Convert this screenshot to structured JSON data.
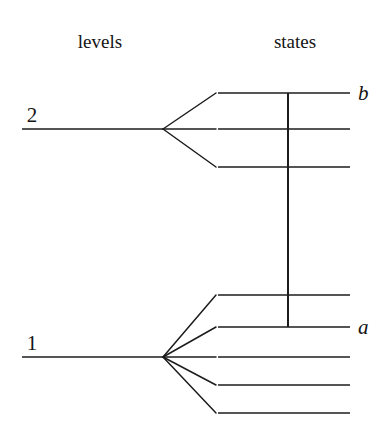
{
  "figure": {
    "title": "",
    "headers": {
      "left": "levels",
      "right": "states"
    },
    "levels": [
      {
        "label": "2",
        "label_x": 32,
        "label_y": 122,
        "line_y": 129,
        "line_x1": 22,
        "line_x2": 163
      },
      {
        "label": "1",
        "label_x": 32,
        "label_y": 350,
        "line_y": 357,
        "line_x1": 22,
        "line_x2": 163
      }
    ],
    "state_groups": [
      {
        "parent_level": "2",
        "vertex_x": 163,
        "vertex_y": 129,
        "line_x1": 218,
        "line_x2": 350,
        "states": [
          {
            "y": 93,
            "label": "b",
            "label_x": 358,
            "label_y": 100
          },
          {
            "y": 129,
            "label": "",
            "label_x": 358,
            "label_y": 136
          },
          {
            "y": 167,
            "label": "",
            "label_x": 358,
            "label_y": 174
          }
        ]
      },
      {
        "parent_level": "1",
        "vertex_x": 163,
        "vertex_y": 357,
        "line_x1": 218,
        "line_x2": 350,
        "states": [
          {
            "y": 295,
            "label": "",
            "label_x": 358,
            "label_y": 302
          },
          {
            "y": 327,
            "label": "a",
            "label_x": 358,
            "label_y": 334
          },
          {
            "y": 357,
            "label": "",
            "label_x": 358,
            "label_y": 364
          },
          {
            "y": 385,
            "label": "",
            "label_x": 358,
            "label_y": 392
          },
          {
            "y": 413,
            "label": "",
            "label_x": 358,
            "label_y": 420
          }
        ]
      }
    ],
    "transition": {
      "name": "b-to-a-transition",
      "x": 288,
      "y1": 93,
      "y2": 327
    },
    "header_positions": {
      "left_x": 100,
      "right_x": 295,
      "y": 48
    },
    "colors": {
      "ink": "#1c1c1c",
      "background": "#ffffff"
    }
  }
}
